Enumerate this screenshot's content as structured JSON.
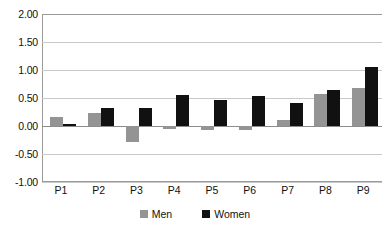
{
  "chart_data": {
    "type": "bar",
    "title": "",
    "subtitle": "",
    "xlabel": "",
    "ylabel": "",
    "categories": [
      "P1",
      "P2",
      "P3",
      "P4",
      "P5",
      "P6",
      "P7",
      "P8",
      "P9"
    ],
    "series": [
      {
        "name": "Men",
        "color": "#949494",
        "values": [
          0.16,
          0.23,
          -0.28,
          -0.06,
          -0.07,
          -0.08,
          0.11,
          0.58,
          0.68
        ]
      },
      {
        "name": "Women",
        "color": "#111111",
        "values": [
          0.03,
          0.32,
          0.32,
          0.55,
          0.46,
          0.53,
          0.41,
          0.65,
          1.05
        ]
      }
    ],
    "ylim": [
      -1.0,
      2.0
    ],
    "ytick_step": 0.5,
    "ytick_labels": [
      "2.00",
      "1.50",
      "1.00",
      "0.50",
      "0.00",
      "-0.50",
      "-1.00"
    ],
    "ytick_values": [
      2.0,
      1.5,
      1.0,
      0.5,
      0.0,
      -0.5,
      -1.0
    ],
    "grid": true,
    "grid_axis": "y",
    "legend_position": "bottom",
    "legend_entries": [
      "Men",
      "Women"
    ]
  },
  "colors": {
    "men": "#949494",
    "women": "#111111",
    "gridline": "#c9c9c9",
    "axis": "#9a9a9a",
    "background": "#ffffff",
    "text": "#111111"
  }
}
